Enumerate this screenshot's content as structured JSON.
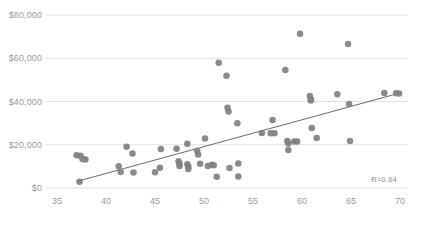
{
  "chart_data": {
    "type": "scatter",
    "title": "",
    "subtitle": "",
    "xlabel": "",
    "ylabel": "",
    "xlim": [
      33.8,
      71.5
    ],
    "ylim": [
      -2000,
      80000
    ],
    "xticks": [
      35,
      40,
      45,
      50,
      55,
      60,
      65,
      70
    ],
    "xticklabels": [
      "35",
      "40",
      "45",
      "50",
      "55",
      "60",
      "65",
      "70"
    ],
    "yticks": [
      0,
      20000,
      40000,
      60000,
      80000
    ],
    "yticklabels": [
      "$0",
      "$20,000",
      "$40,000",
      "$60,000",
      "$80,000"
    ],
    "grid": "horizontal",
    "legend": "none",
    "marker_color": "#808080",
    "marker_size": 6.5,
    "gridline_color": "#e2e2e2",
    "axis_label_color": "#9a9a9a",
    "trendline": {
      "type": "linear",
      "color": "#5a5a5a",
      "x_start": 37.0,
      "y_start": 3000,
      "x_end": 70.2,
      "y_end": 44200
    },
    "annotations": [
      {
        "text": "R=0.64",
        "x": 68.5,
        "y": 3800
      }
    ],
    "points": [
      {
        "x": 37.0,
        "y": 15200
      },
      {
        "x": 37.4,
        "y": 14900
      },
      {
        "x": 37.6,
        "y": 13400
      },
      {
        "x": 37.9,
        "y": 13200
      },
      {
        "x": 37.3,
        "y": 2900
      },
      {
        "x": 41.3,
        "y": 10100
      },
      {
        "x": 41.5,
        "y": 7400
      },
      {
        "x": 42.1,
        "y": 19100
      },
      {
        "x": 42.7,
        "y": 16000
      },
      {
        "x": 42.8,
        "y": 7200
      },
      {
        "x": 45.0,
        "y": 7300
      },
      {
        "x": 45.5,
        "y": 9400
      },
      {
        "x": 45.6,
        "y": 18000
      },
      {
        "x": 47.2,
        "y": 18100
      },
      {
        "x": 47.4,
        "y": 12400
      },
      {
        "x": 47.5,
        "y": 11300
      },
      {
        "x": 47.5,
        "y": 10200
      },
      {
        "x": 48.3,
        "y": 20500
      },
      {
        "x": 48.3,
        "y": 11000
      },
      {
        "x": 48.4,
        "y": 9900
      },
      {
        "x": 48.4,
        "y": 8800
      },
      {
        "x": 49.3,
        "y": 17200
      },
      {
        "x": 49.4,
        "y": 15500
      },
      {
        "x": 49.6,
        "y": 11200
      },
      {
        "x": 50.1,
        "y": 22900
      },
      {
        "x": 50.4,
        "y": 10200
      },
      {
        "x": 50.8,
        "y": 10700
      },
      {
        "x": 51.0,
        "y": 10500
      },
      {
        "x": 51.3,
        "y": 5200
      },
      {
        "x": 51.5,
        "y": 57900
      },
      {
        "x": 52.3,
        "y": 51900
      },
      {
        "x": 52.4,
        "y": 37100
      },
      {
        "x": 52.5,
        "y": 35400
      },
      {
        "x": 52.6,
        "y": 9200
      },
      {
        "x": 53.4,
        "y": 30000
      },
      {
        "x": 53.5,
        "y": 11300
      },
      {
        "x": 53.5,
        "y": 5300
      },
      {
        "x": 55.9,
        "y": 25400
      },
      {
        "x": 56.8,
        "y": 25300
      },
      {
        "x": 57.0,
        "y": 31400
      },
      {
        "x": 57.2,
        "y": 25300
      },
      {
        "x": 58.3,
        "y": 54600
      },
      {
        "x": 58.5,
        "y": 21700
      },
      {
        "x": 58.6,
        "y": 20600
      },
      {
        "x": 58.6,
        "y": 17600
      },
      {
        "x": 59.2,
        "y": 21500
      },
      {
        "x": 59.5,
        "y": 21500
      },
      {
        "x": 59.8,
        "y": 71300
      },
      {
        "x": 60.8,
        "y": 42600
      },
      {
        "x": 60.9,
        "y": 41000
      },
      {
        "x": 60.9,
        "y": 40500
      },
      {
        "x": 61.0,
        "y": 27800
      },
      {
        "x": 61.5,
        "y": 23100
      },
      {
        "x": 63.6,
        "y": 43400
      },
      {
        "x": 64.7,
        "y": 66600
      },
      {
        "x": 64.8,
        "y": 38900
      },
      {
        "x": 64.9,
        "y": 21700
      },
      {
        "x": 68.4,
        "y": 43900
      },
      {
        "x": 69.6,
        "y": 43800
      },
      {
        "x": 69.9,
        "y": 43700
      }
    ]
  },
  "footer": {
    "note": ""
  }
}
